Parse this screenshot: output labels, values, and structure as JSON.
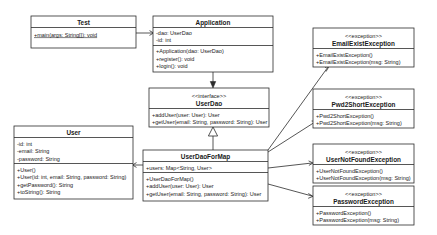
{
  "diagram": {
    "stereotypes": {
      "interface": "<<interface>>",
      "exception": "<<exception>>"
    },
    "classes": {
      "test": {
        "name": "Test",
        "methods": [
          "+main(args: String[]): void"
        ]
      },
      "application": {
        "name": "Application",
        "fields": [
          "-dao: UserDao",
          "-id: int"
        ],
        "methods": [
          "+Application(dao: UserDao)",
          "+register(): void",
          "+login(): void"
        ]
      },
      "userdao": {
        "stereotype": "<<interface>>",
        "name": "UserDao",
        "methods": [
          "+addUser(user: User): User",
          "+getUser(email: String, password: String): User"
        ]
      },
      "userdaoformap": {
        "name": "UserDaoForMap",
        "fields": [
          "+users: Map<String, User>"
        ],
        "methods": [
          "+UserDaoForMap()",
          "+addUser(user: User): User",
          "+getUser(email: String, password: String): User"
        ]
      },
      "user": {
        "name": "User",
        "fields": [
          "-id: int",
          "-email: String",
          "-password: String"
        ],
        "methods": [
          "+User()",
          "+User(id: int, email: String, password: String)",
          "+getPassword(): String",
          "+toString(): String"
        ]
      },
      "emailexistexception": {
        "stereotype": "<<exception>>",
        "name": "EmailExistException",
        "methods": [
          "+EmailExistException()",
          "+EmailExistException(msg: String)"
        ]
      },
      "pwd2shortexception": {
        "stereotype": "<<exception>>",
        "name": "Pwd2ShortException",
        "methods": [
          "+Pwd2ShortException()",
          "+Pwd2ShortException(msg: String)"
        ]
      },
      "usernotfoundexception": {
        "stereotype": "<<exception>>",
        "name": "UserNotFoundException",
        "methods": [
          "+UserNotFoundException()",
          "+UserNotFoundException(msg: String)"
        ]
      },
      "passwordexception": {
        "stereotype": "<<exception>>",
        "name": "PasswordException",
        "methods": [
          "+PasswordException()",
          "+PasswordException(msg: String)"
        ]
      }
    },
    "colors": {
      "line": "#2b2b2b",
      "text": "#1a1a1a",
      "fill": "#ffffff"
    }
  }
}
